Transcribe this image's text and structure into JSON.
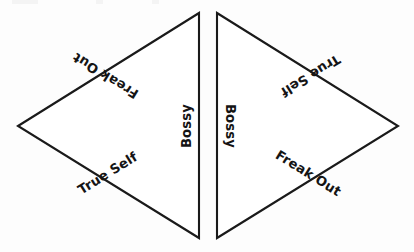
{
  "diagram": {
    "type": "mirrored-triangles",
    "background_color": "#fdfdfd",
    "stroke_color": "#1a1a1a",
    "text_color": "#141414",
    "left_triangle": {
      "name": "left-triangle",
      "points": "18,126 199,13 199,238",
      "edges": {
        "upper_left_label": "Freak Out",
        "lower_left_label": "True Self",
        "vertical_label": "Bossy"
      }
    },
    "right_triangle": {
      "name": "right-triangle",
      "points": "217,13 398,126 217,238",
      "edges": {
        "upper_right_label": "True Self",
        "lower_right_label": "Freak Out",
        "vertical_label": "Bossy"
      }
    },
    "labels": [
      {
        "id": "left-upper",
        "text": "Freak Out"
      },
      {
        "id": "left-lower",
        "text": "True Self"
      },
      {
        "id": "left-vertical",
        "text": "Bossy"
      },
      {
        "id": "right-vertical",
        "text": "Bossy"
      },
      {
        "id": "right-upper",
        "text": "True Self"
      },
      {
        "id": "right-lower",
        "text": "Freak Out"
      }
    ]
  }
}
